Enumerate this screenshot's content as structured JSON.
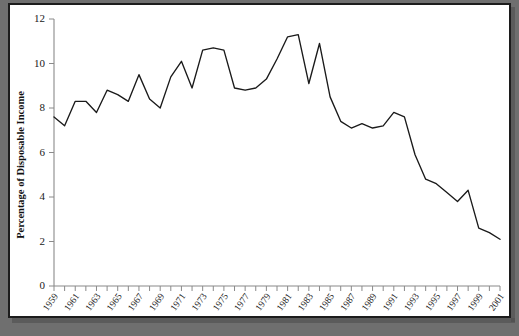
{
  "figure": {
    "frame_border_color": "#1c1c1c",
    "background_color": "#ffffff",
    "page_background_color": "#6f6f6f",
    "line_color": "#1a1a1a",
    "axis_color": "#8a8a8a"
  },
  "chart_data": {
    "type": "line",
    "title": "",
    "xlabel": "",
    "ylabel": "Percentage of Disposable Income",
    "xlim": [
      1959,
      2001
    ],
    "ylim": [
      0,
      12
    ],
    "ytick_labels": [
      "0",
      "2",
      "4",
      "6",
      "8",
      "10",
      "12"
    ],
    "ytick_values": [
      0,
      2,
      4,
      6,
      8,
      10,
      12
    ],
    "grid": false,
    "legend": "none",
    "xtick_labels": [
      "1959",
      "1961",
      "1963",
      "1965",
      "1967",
      "1969",
      "1971",
      "1973",
      "1975",
      "1977",
      "1979",
      "1981",
      "1983",
      "1985",
      "1987",
      "1989",
      "1991",
      "1993",
      "1995",
      "1997",
      "1999",
      "2001"
    ],
    "xtick_values": [
      1959,
      1961,
      1963,
      1965,
      1967,
      1969,
      1971,
      1973,
      1975,
      1977,
      1979,
      1981,
      1983,
      1985,
      1987,
      1989,
      1991,
      1993,
      1995,
      1997,
      1999,
      2001
    ],
    "x": [
      1959,
      1960,
      1961,
      1962,
      1963,
      1964,
      1965,
      1966,
      1967,
      1968,
      1969,
      1970,
      1971,
      1972,
      1973,
      1974,
      1975,
      1976,
      1977,
      1978,
      1979,
      1980,
      1981,
      1982,
      1983,
      1984,
      1985,
      1986,
      1987,
      1988,
      1989,
      1990,
      1991,
      1992,
      1993,
      1994,
      1995,
      1996,
      1997,
      1998,
      1999,
      2000,
      2001
    ],
    "values": [
      7.6,
      7.2,
      8.3,
      8.3,
      7.8,
      8.8,
      8.6,
      8.3,
      9.5,
      8.4,
      8.0,
      9.4,
      10.1,
      8.9,
      10.6,
      10.7,
      10.6,
      8.9,
      8.8,
      8.9,
      9.3,
      10.2,
      11.2,
      11.3,
      9.1,
      10.9,
      8.5,
      7.4,
      7.1,
      7.3,
      7.1,
      7.2,
      7.8,
      7.6,
      5.9,
      4.8,
      4.6,
      4.2,
      3.8,
      4.3,
      2.6,
      2.4,
      2.1
    ],
    "series_name": "Personal saving rate"
  }
}
